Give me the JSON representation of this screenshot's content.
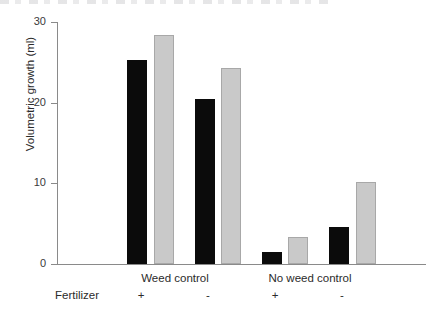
{
  "figure": {
    "background": "#ffffff",
    "width": 432,
    "height": 319
  },
  "labels": {
    "row_label": "Fertilizer",
    "y_axis_title": "Volumetric growth (ml)"
  },
  "chart_data": {
    "type": "bar",
    "title": "",
    "xlabel": "",
    "ylabel": "Volumetric growth (ml)",
    "ylim": [
      0,
      30
    ],
    "yticks": [
      0,
      10,
      20,
      30
    ],
    "ytick_labels": [
      "0",
      "10",
      "20",
      "30"
    ],
    "grid": false,
    "legend": null,
    "categories": [
      "Weed control",
      "No weed control"
    ],
    "subcategories": [
      "+",
      "-"
    ],
    "series": [
      {
        "name": "black",
        "color": "#0b0b0b"
      },
      {
        "name": "grey",
        "color": "#c9c9c9"
      }
    ],
    "bars": [
      {
        "group": "Weed control",
        "fertilizer": "+",
        "series": "black",
        "value": 25.0
      },
      {
        "group": "Weed control",
        "fertilizer": "+",
        "series": "grey",
        "value": 28.2
      },
      {
        "group": "Weed control",
        "fertilizer": "-",
        "series": "black",
        "value": 20.2
      },
      {
        "group": "Weed control",
        "fertilizer": "-",
        "series": "grey",
        "value": 24.0
      },
      {
        "group": "No weed control",
        "fertilizer": "+",
        "series": "black",
        "value": 1.2
      },
      {
        "group": "No weed control",
        "fertilizer": "+",
        "series": "grey",
        "value": 3.1
      },
      {
        "group": "No weed control",
        "fertilizer": "-",
        "series": "black",
        "value": 4.4
      },
      {
        "group": "No weed control",
        "fertilizer": "-",
        "series": "grey",
        "value": 9.9
      }
    ]
  }
}
